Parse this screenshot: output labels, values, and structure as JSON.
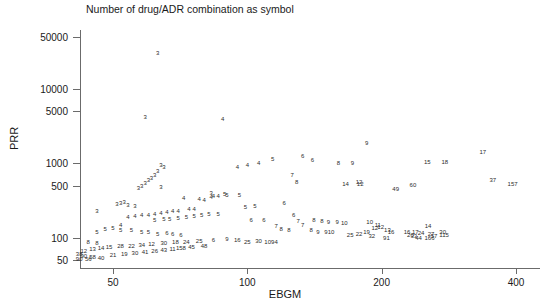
{
  "chart_data": {
    "type": "scatter",
    "title": "Number of drug/ADR combination as symbol",
    "xlabel": "EBGM",
    "ylabel": "PRR",
    "xscale": "log",
    "yscale": "log",
    "xlim": [
      40,
      430
    ],
    "ylim": [
      42,
      60000
    ],
    "grid": false,
    "legend": null,
    "point_marker": "numeric-label",
    "marker_note": "Each plotted point is drawn as a number giving the count of drug/ADR combinations at that location",
    "xticks": [
      50,
      100,
      200,
      400
    ],
    "xtick_labels": [
      "50",
      "100",
      "200",
      "400"
    ],
    "yticks": [
      50,
      100,
      500,
      1000,
      5000,
      10000,
      50000
    ],
    "ytick_labels": [
      "50",
      "100",
      "500",
      "1000",
      "5000",
      "10000",
      "50000"
    ],
    "points": [
      {
        "x": 63,
        "y": 30000,
        "n": "3"
      },
      {
        "x": 59,
        "y": 4200,
        "n": "3"
      },
      {
        "x": 88,
        "y": 4000,
        "n": "4"
      },
      {
        "x": 185,
        "y": 1850,
        "n": "9"
      },
      {
        "x": 114,
        "y": 1150,
        "n": "5"
      },
      {
        "x": 133,
        "y": 1250,
        "n": "6"
      },
      {
        "x": 140,
        "y": 1100,
        "n": "6"
      },
      {
        "x": 160,
        "y": 1000,
        "n": "8"
      },
      {
        "x": 172,
        "y": 1000,
        "n": "9"
      },
      {
        "x": 253,
        "y": 1050,
        "n": "15"
      },
      {
        "x": 277,
        "y": 1030,
        "n": "18"
      },
      {
        "x": 337,
        "y": 1400,
        "n": "17"
      },
      {
        "x": 355,
        "y": 600,
        "n": "37"
      },
      {
        "x": 393,
        "y": 530,
        "n": "157"
      },
      {
        "x": 106,
        "y": 1020,
        "n": "4"
      },
      {
        "x": 83,
        "y": 400,
        "n": "3"
      },
      {
        "x": 126,
        "y": 700,
        "n": "7"
      },
      {
        "x": 129,
        "y": 560,
        "n": "8"
      },
      {
        "x": 178,
        "y": 560,
        "n": "12"
      },
      {
        "x": 179,
        "y": 520,
        "n": "12"
      },
      {
        "x": 166,
        "y": 530,
        "n": "14"
      },
      {
        "x": 215,
        "y": 450,
        "n": "49"
      },
      {
        "x": 235,
        "y": 510,
        "n": "60"
      },
      {
        "x": 100,
        "y": 960,
        "n": "4"
      },
      {
        "x": 95,
        "y": 880,
        "n": "4"
      },
      {
        "x": 64,
        "y": 950,
        "n": "3"
      },
      {
        "x": 65,
        "y": 880,
        "n": "3"
      },
      {
        "x": 63,
        "y": 780,
        "n": "3"
      },
      {
        "x": 62,
        "y": 700,
        "n": "3"
      },
      {
        "x": 61,
        "y": 640,
        "n": "3"
      },
      {
        "x": 60,
        "y": 600,
        "n": "3"
      },
      {
        "x": 59,
        "y": 550,
        "n": "3"
      },
      {
        "x": 58,
        "y": 500,
        "n": "3"
      },
      {
        "x": 57,
        "y": 470,
        "n": "3"
      },
      {
        "x": 64,
        "y": 480,
        "n": "3"
      },
      {
        "x": 53,
        "y": 300,
        "n": "3"
      },
      {
        "x": 52,
        "y": 290,
        "n": "3"
      },
      {
        "x": 51,
        "y": 280,
        "n": "3"
      },
      {
        "x": 54,
        "y": 275,
        "n": "3"
      },
      {
        "x": 56,
        "y": 270,
        "n": "3"
      },
      {
        "x": 46,
        "y": 230,
        "n": "3"
      },
      {
        "x": 72,
        "y": 340,
        "n": "4"
      },
      {
        "x": 78,
        "y": 330,
        "n": "4"
      },
      {
        "x": 84,
        "y": 360,
        "n": "4"
      },
      {
        "x": 86,
        "y": 360,
        "n": "4"
      },
      {
        "x": 83,
        "y": 350,
        "n": "4"
      },
      {
        "x": 80,
        "y": 320,
        "n": "4"
      },
      {
        "x": 74,
        "y": 240,
        "n": "4"
      },
      {
        "x": 76,
        "y": 240,
        "n": "4"
      },
      {
        "x": 70,
        "y": 230,
        "n": "4"
      },
      {
        "x": 68,
        "y": 225,
        "n": "4"
      },
      {
        "x": 66,
        "y": 220,
        "n": "4"
      },
      {
        "x": 64,
        "y": 215,
        "n": "4"
      },
      {
        "x": 62,
        "y": 210,
        "n": "4"
      },
      {
        "x": 60,
        "y": 200,
        "n": "4"
      },
      {
        "x": 58,
        "y": 200,
        "n": "4"
      },
      {
        "x": 56,
        "y": 195,
        "n": "4"
      },
      {
        "x": 54,
        "y": 190,
        "n": "4"
      },
      {
        "x": 52,
        "y": 150,
        "n": "4"
      },
      {
        "x": 89,
        "y": 390,
        "n": "5"
      },
      {
        "x": 90,
        "y": 380,
        "n": "5"
      },
      {
        "x": 96,
        "y": 380,
        "n": "5"
      },
      {
        "x": 104,
        "y": 270,
        "n": "5"
      },
      {
        "x": 99,
        "y": 260,
        "n": "5"
      },
      {
        "x": 86,
        "y": 210,
        "n": "5"
      },
      {
        "x": 82,
        "y": 205,
        "n": "5"
      },
      {
        "x": 79,
        "y": 200,
        "n": "5"
      },
      {
        "x": 76,
        "y": 195,
        "n": "5"
      },
      {
        "x": 73,
        "y": 190,
        "n": "5"
      },
      {
        "x": 70,
        "y": 185,
        "n": "5"
      },
      {
        "x": 67,
        "y": 180,
        "n": "5"
      },
      {
        "x": 65,
        "y": 178,
        "n": "5"
      },
      {
        "x": 62,
        "y": 175,
        "n": "5"
      },
      {
        "x": 50,
        "y": 135,
        "n": "5"
      },
      {
        "x": 48,
        "y": 130,
        "n": "5"
      },
      {
        "x": 52,
        "y": 128,
        "n": "5"
      },
      {
        "x": 55,
        "y": 125,
        "n": "5"
      },
      {
        "x": 58,
        "y": 120,
        "n": "5"
      },
      {
        "x": 60,
        "y": 118,
        "n": "5"
      },
      {
        "x": 63,
        "y": 112,
        "n": "5"
      },
      {
        "x": 46,
        "y": 120,
        "n": "5"
      },
      {
        "x": 121,
        "y": 290,
        "n": "6"
      },
      {
        "x": 127,
        "y": 200,
        "n": "6"
      },
      {
        "x": 109,
        "y": 175,
        "n": "6"
      },
      {
        "x": 102,
        "y": 170,
        "n": "6"
      },
      {
        "x": 66,
        "y": 115,
        "n": "6"
      },
      {
        "x": 68,
        "y": 112,
        "n": "6"
      },
      {
        "x": 71,
        "y": 110,
        "n": "6"
      },
      {
        "x": 130,
        "y": 165,
        "n": "7"
      },
      {
        "x": 133,
        "y": 150,
        "n": "7"
      },
      {
        "x": 116,
        "y": 145,
        "n": "7"
      },
      {
        "x": 141,
        "y": 170,
        "n": "8"
      },
      {
        "x": 147,
        "y": 165,
        "n": "8"
      },
      {
        "x": 119,
        "y": 130,
        "n": "8"
      },
      {
        "x": 124,
        "y": 128,
        "n": "8"
      },
      {
        "x": 139,
        "y": 125,
        "n": "8"
      },
      {
        "x": 44,
        "y": 88,
        "n": "8"
      },
      {
        "x": 46,
        "y": 85,
        "n": "8"
      },
      {
        "x": 152,
        "y": 160,
        "n": "9"
      },
      {
        "x": 159,
        "y": 160,
        "n": "9"
      },
      {
        "x": 144,
        "y": 120,
        "n": "9"
      },
      {
        "x": 150,
        "y": 118,
        "n": "9"
      },
      {
        "x": 165,
        "y": 155,
        "n": "10"
      },
      {
        "x": 154,
        "y": 118,
        "n": "10"
      },
      {
        "x": 188,
        "y": 160,
        "n": "10"
      },
      {
        "x": 196,
        "y": 150,
        "n": "11"
      },
      {
        "x": 199,
        "y": 140,
        "n": "12"
      },
      {
        "x": 193,
        "y": 135,
        "n": "12"
      },
      {
        "x": 206,
        "y": 125,
        "n": "13"
      },
      {
        "x": 210,
        "y": 118,
        "n": "16"
      },
      {
        "x": 185,
        "y": 120,
        "n": "19"
      },
      {
        "x": 178,
        "y": 112,
        "n": "22"
      },
      {
        "x": 170,
        "y": 110,
        "n": "25"
      },
      {
        "x": 190,
        "y": 105,
        "n": "32"
      },
      {
        "x": 205,
        "y": 100,
        "n": "91"
      },
      {
        "x": 228,
        "y": 120,
        "n": "16"
      },
      {
        "x": 238,
        "y": 118,
        "n": "17"
      },
      {
        "x": 245,
        "y": 115,
        "n": "24"
      },
      {
        "x": 232,
        "y": 110,
        "n": "20"
      },
      {
        "x": 236,
        "y": 105,
        "n": "33"
      },
      {
        "x": 242,
        "y": 100,
        "n": "44"
      },
      {
        "x": 258,
        "y": 112,
        "n": "27"
      },
      {
        "x": 262,
        "y": 105,
        "n": "57"
      },
      {
        "x": 256,
        "y": 100,
        "n": "166"
      },
      {
        "x": 274,
        "y": 118,
        "n": "30"
      },
      {
        "x": 276,
        "y": 110,
        "n": "115"
      },
      {
        "x": 254,
        "y": 145,
        "n": "14"
      },
      {
        "x": 90,
        "y": 95,
        "n": "9"
      },
      {
        "x": 95,
        "y": 92,
        "n": "16"
      },
      {
        "x": 100,
        "y": 88,
        "n": "25"
      },
      {
        "x": 106,
        "y": 90,
        "n": "30"
      },
      {
        "x": 112,
        "y": 88,
        "n": "109"
      },
      {
        "x": 116,
        "y": 86,
        "n": "4"
      },
      {
        "x": 84,
        "y": 92,
        "n": "6"
      },
      {
        "x": 78,
        "y": 90,
        "n": "25"
      },
      {
        "x": 73,
        "y": 88,
        "n": "24"
      },
      {
        "x": 69,
        "y": 86,
        "n": "18"
      },
      {
        "x": 65,
        "y": 84,
        "n": "30"
      },
      {
        "x": 61,
        "y": 82,
        "n": "12"
      },
      {
        "x": 58,
        "y": 80,
        "n": "34"
      },
      {
        "x": 55,
        "y": 78,
        "n": "22"
      },
      {
        "x": 52,
        "y": 76,
        "n": "28"
      },
      {
        "x": 49,
        "y": 74,
        "n": "15"
      },
      {
        "x": 47,
        "y": 72,
        "n": "14"
      },
      {
        "x": 45,
        "y": 70,
        "n": "13"
      },
      {
        "x": 43,
        "y": 66,
        "n": "12"
      },
      {
        "x": 42,
        "y": 60,
        "n": "38"
      },
      {
        "x": 43,
        "y": 56,
        "n": "90"
      },
      {
        "x": 45,
        "y": 55,
        "n": "58"
      },
      {
        "x": 47,
        "y": 54,
        "n": "40"
      },
      {
        "x": 50,
        "y": 58,
        "n": "21"
      },
      {
        "x": 53,
        "y": 60,
        "n": "19"
      },
      {
        "x": 56,
        "y": 62,
        "n": "30"
      },
      {
        "x": 59,
        "y": 64,
        "n": "41"
      },
      {
        "x": 62,
        "y": 66,
        "n": "26"
      },
      {
        "x": 65,
        "y": 68,
        "n": "43"
      },
      {
        "x": 68,
        "y": 70,
        "n": "11"
      },
      {
        "x": 71,
        "y": 72,
        "n": "158"
      },
      {
        "x": 75,
        "y": 74,
        "n": "45"
      },
      {
        "x": 80,
        "y": 76,
        "n": "48"
      },
      {
        "x": 42,
        "y": 52,
        "n": "90"
      },
      {
        "x": 44,
        "y": 51,
        "n": "56"
      }
    ]
  },
  "axes": {
    "y_title": "PRR",
    "x_title": "EBGM"
  }
}
